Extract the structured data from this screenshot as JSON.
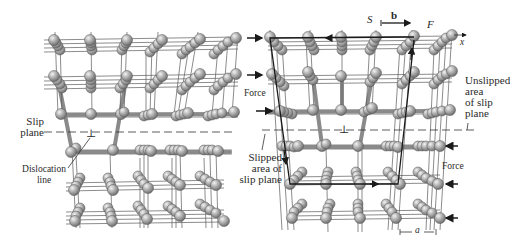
{
  "figure": {
    "left_panel": {
      "labels": {
        "slip_plane": [
          "Slip",
          "plane"
        ],
        "dislocation_line": [
          "Dislocation",
          "line"
        ],
        "dislocation_symbol": "⊥"
      }
    },
    "right_panel": {
      "labels": {
        "start": "S",
        "finish": "F",
        "burgers_vector": "b",
        "x_axis": "x",
        "force_left": "Force",
        "force_right": "Force",
        "unslipped_area": [
          "Unslipped",
          "area",
          "of slip",
          "plane"
        ],
        "slipped_area": [
          "Slipped",
          "area of",
          "slip plane"
        ],
        "lattice_spacing": "a",
        "dislocation_symbol": "⊥"
      }
    },
    "colors": {
      "atom": "#9a9a9a",
      "atom_highlight": "#e8e8e8",
      "bond": "#6a6a6a",
      "thick_bond": "#8c8c8c",
      "circuit": "#1a1a1a",
      "text": "#2a2a2a"
    }
  }
}
